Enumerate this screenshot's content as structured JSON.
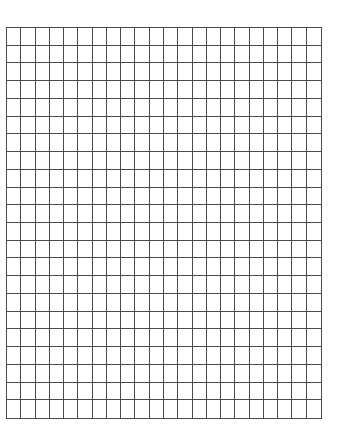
{
  "document": {
    "type": "graph-paper-worksheet",
    "background_color": "#ffffff"
  },
  "grid": {
    "columns": 22,
    "rows": 22,
    "left": 6,
    "top": 27,
    "width": 316,
    "height": 392,
    "line_color": "#4a4a4a",
    "line_width": 1
  }
}
